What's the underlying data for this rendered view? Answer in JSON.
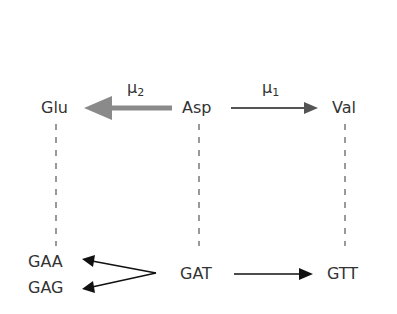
{
  "amino_acids": {
    "glu": "Glu",
    "asp": "Asp",
    "val": "Val"
  },
  "codons": {
    "gaa": "GAA",
    "gag": "GAG",
    "gat": "GAT",
    "gtt": "GTT"
  },
  "mutations": {
    "mu2": {
      "symbol": "μ",
      "subscript": "2"
    },
    "mu1": {
      "symbol": "μ",
      "subscript": "1"
    }
  },
  "colors": {
    "thick_arrow": "#8a8a8a",
    "thin_arrow": "#555555",
    "dashed": "#999999",
    "text": "#333333",
    "codon_arrow": "#111111"
  }
}
